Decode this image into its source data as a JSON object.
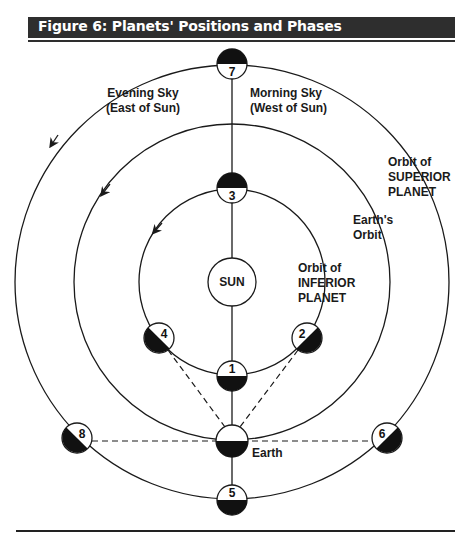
{
  "figure": {
    "title": "Figure 6: Planets' Positions and Phases"
  },
  "labels": {
    "evening_sky_line1": "Evening Sky",
    "evening_sky_line2": "(East of Sun)",
    "morning_sky_line1": "Morning Sky",
    "morning_sky_line2": "(West of Sun)",
    "superior_orbit_line1": "Orbit of",
    "superior_orbit_line2": "SUPERIOR",
    "superior_orbit_line3": "PLANET",
    "earth_orbit_line1": "Earth's",
    "earth_orbit_line2": "Orbit",
    "inferior_orbit_line1": "Orbit of",
    "inferior_orbit_line2": "INFERIOR",
    "inferior_orbit_line3": "PLANET",
    "sun": "SUN",
    "earth": "Earth"
  },
  "planets": [
    {
      "id": "1",
      "label": "1",
      "orbit": "inferior"
    },
    {
      "id": "2",
      "label": "2",
      "orbit": "inferior"
    },
    {
      "id": "3",
      "label": "3",
      "orbit": "inferior"
    },
    {
      "id": "4",
      "label": "4",
      "orbit": "inferior"
    },
    {
      "id": "5",
      "label": "5",
      "orbit": "superior"
    },
    {
      "id": "6",
      "label": "6",
      "orbit": "superior"
    },
    {
      "id": "7",
      "label": "7",
      "orbit": "superior"
    },
    {
      "id": "8",
      "label": "8",
      "orbit": "superior"
    }
  ],
  "colors": {
    "header_bg": "#2e2e2e",
    "header_text": "#ffffff",
    "line": "#1a1a1a",
    "shadow": "#000000"
  }
}
